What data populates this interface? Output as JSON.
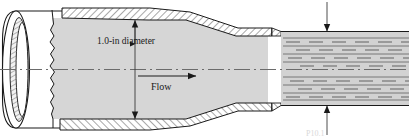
{
  "figure": {
    "type": "engineering-cross-section-diagram"
  },
  "labels": {
    "diameter": "1.0-in diameter",
    "flow": "Flow",
    "clipped_caption": "P10.1"
  },
  "annotations": {
    "diameter_dimension": {
      "value": "1.0",
      "unit": "in",
      "quantity": "diameter",
      "arrow_style": "double-headed-vertical"
    },
    "flow_arrow": {
      "direction": "right",
      "label": "Flow"
    },
    "jet_dimension": {
      "arrow_style": "inward-pair-vertical",
      "label": ""
    }
  },
  "colors": {
    "fluid_fill": "#d6d6d6",
    "jet_fill": "#d2d2d2",
    "wall_hatch": "#4a4a4a",
    "outline": "#1a1a1a",
    "centerline": "#6b6b6b",
    "pipe_body": "#ffffff",
    "background": "#ffffff",
    "text": "#1a1a1a"
  },
  "components": {
    "pipe_inlet": "cylindrical-pipe-3d-end",
    "break_line": "jagged-section-break",
    "nozzle_body": "converging-nozzle-walls-hatched",
    "nozzle_exit": "vertical-exit-face",
    "free_jet": "horizontal-jet-with-streamlines",
    "centerline": "dash-dot-axis"
  },
  "streamlines": {
    "style": "horizontal-dashed",
    "count": 9
  }
}
